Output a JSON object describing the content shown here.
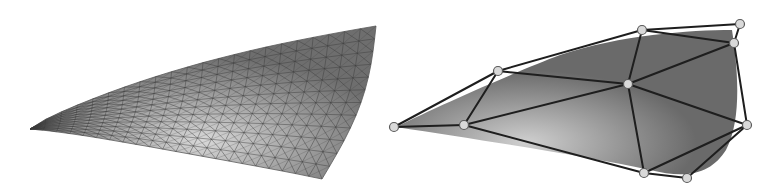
{
  "figure": {
    "panels": [
      {
        "id": "smooth-surface",
        "description": "Curved surface with dense triangle mesh",
        "corners": {
          "left_tip": [
            30,
            129
          ],
          "top_right": [
            376,
            26
          ],
          "bottom_right": [
            322,
            179
          ]
        },
        "grid": {
          "u_divisions": 22,
          "v_divisions": 12
        },
        "colors": {
          "fill_dark": "#6e6e6e",
          "fill_light": "#d8d8d8",
          "line": "#3a3a3a"
        }
      },
      {
        "id": "coarse-mesh",
        "description": "Coarse triangulation over a shaded surface",
        "nodes": [
          {
            "id": "A",
            "x": 394,
            "y": 127
          },
          {
            "id": "B",
            "x": 464,
            "y": 125
          },
          {
            "id": "C",
            "x": 498,
            "y": 71
          },
          {
            "id": "D",
            "x": 642,
            "y": 30
          },
          {
            "id": "E",
            "x": 628,
            "y": 84
          },
          {
            "id": "F",
            "x": 740,
            "y": 24
          },
          {
            "id": "G",
            "x": 734,
            "y": 43
          },
          {
            "id": "H",
            "x": 747,
            "y": 125
          },
          {
            "id": "I",
            "x": 644,
            "y": 173
          },
          {
            "id": "J",
            "x": 687,
            "y": 178
          }
        ],
        "edges": [
          [
            "A",
            "B"
          ],
          [
            "A",
            "C"
          ],
          [
            "B",
            "C"
          ],
          [
            "C",
            "D"
          ],
          [
            "C",
            "E"
          ],
          [
            "B",
            "E"
          ],
          [
            "D",
            "E"
          ],
          [
            "D",
            "F"
          ],
          [
            "D",
            "G"
          ],
          [
            "F",
            "G"
          ],
          [
            "E",
            "G"
          ],
          [
            "G",
            "H"
          ],
          [
            "E",
            "H"
          ],
          [
            "E",
            "I"
          ],
          [
            "B",
            "I"
          ],
          [
            "I",
            "H"
          ],
          [
            "I",
            "J"
          ],
          [
            "J",
            "H"
          ]
        ],
        "colors": {
          "fill_dark": "#6a6a6a",
          "fill_light": "#cfcfcf",
          "edge": "#1e1e1e",
          "node_fill": "#d9d9d9",
          "node_stroke": "#5a5a5a"
        }
      }
    ]
  }
}
